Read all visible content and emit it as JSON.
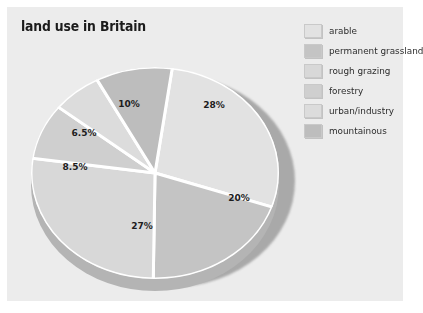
{
  "chart_title": "land use in Britain",
  "colors": {
    "panel_background": "#ececec",
    "page_background": "#ffffff",
    "title_text": "#1b1b1b",
    "label_text": "#1d1d1d",
    "slice_separator": "#ffffff",
    "pie_side_wall": "#b4b4b4",
    "pie_drop_shadow": "#a9a9a9"
  },
  "legend": {
    "position": "right",
    "items": [
      {
        "label": "arable",
        "swatch_color": "#e2e2e2"
      },
      {
        "label": "permanent grassland",
        "swatch_color": "#c4c4c4"
      },
      {
        "label": "rough grazing",
        "swatch_color": "#d8d8d8"
      },
      {
        "label": "forestry",
        "swatch_color": "#cfcfcf"
      },
      {
        "label": "urban/industry",
        "swatch_color": "#dcdcdc"
      },
      {
        "label": "mountainous",
        "swatch_color": "#bdbdbd"
      }
    ]
  },
  "chart_data": {
    "type": "pie",
    "title": "land use in Britain",
    "xlabel": "",
    "ylabel": "",
    "grid": false,
    "legend_position": "right",
    "style": "3d-pie-with-drop-shadow",
    "categories": [
      "arable",
      "permanent grassland",
      "rough grazing",
      "forestry",
      "urban/industry",
      "mountainous"
    ],
    "values": [
      28,
      20,
      27,
      8.5,
      6.5,
      10
    ],
    "data_labels": [
      "28%",
      "20%",
      "27%",
      "8.5%",
      "6.5%",
      "10%"
    ],
    "slice_colors": [
      "#e2e2e2",
      "#c4c4c4",
      "#d8d8d8",
      "#cfcfcf",
      "#dcdcdc",
      "#bdbdbd"
    ],
    "total": 100,
    "units": "percent"
  },
  "slice_labels": [
    {
      "text": "28%",
      "left": 195,
      "top": 45
    },
    {
      "text": "20%",
      "left": 220,
      "top": 138
    },
    {
      "text": "27%",
      "left": 123,
      "top": 166
    },
    {
      "text": "8.5%",
      "left": 56,
      "top": 107
    },
    {
      "text": "6.5%",
      "left": 65,
      "top": 73
    },
    {
      "text": "10%",
      "left": 110,
      "top": 44
    }
  ]
}
